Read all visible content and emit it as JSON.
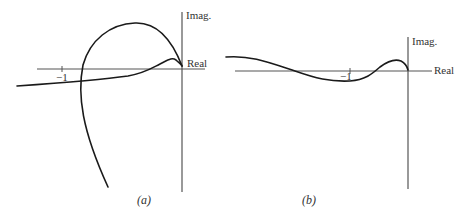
{
  "figure": {
    "panels": [
      {
        "id": "a",
        "caption": "(a)",
        "axis_labels": {
          "imag": "Imag.",
          "real": "Real"
        },
        "tick_label": "−1"
      },
      {
        "id": "b",
        "caption": "(b)",
        "axis_labels": {
          "imag": "Imag.",
          "real": "Real"
        },
        "tick_label": "−1"
      }
    ],
    "colors": {
      "axis": "#555555",
      "curve": "#1a1a1a",
      "text": "#333333"
    }
  }
}
